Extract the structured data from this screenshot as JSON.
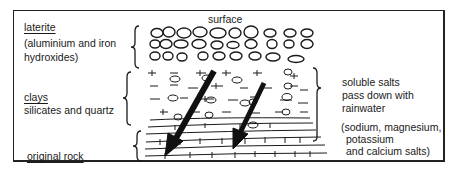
{
  "diagram": {
    "top_label": "surface",
    "layers": [
      {
        "name": "laterite",
        "description": "(aluminium and iron hydroxides)",
        "description_lines": [
          "(aluminium and iron",
          "hydroxides)"
        ]
      },
      {
        "name": "clays",
        "description": "silicates and quartz"
      },
      {
        "name": "original rock",
        "description": ""
      }
    ],
    "process": {
      "lines": [
        "soluble salts",
        "pass down with",
        "rainwater"
      ],
      "examples_lines": [
        "(sodium, magnesium,",
        "potassium",
        "and calcium salts)"
      ]
    },
    "arrows": [
      {
        "from": [
          214,
          72
        ],
        "to": [
          167,
          155
        ],
        "meaning": "rainwater leaching salts downward"
      },
      {
        "from": [
          263,
          84
        ],
        "to": [
          234,
          148
        ],
        "meaning": "rainwater leaching salts downward"
      }
    ],
    "colors": {
      "ink": "#1a1a1a",
      "background": "#ffffff"
    }
  }
}
